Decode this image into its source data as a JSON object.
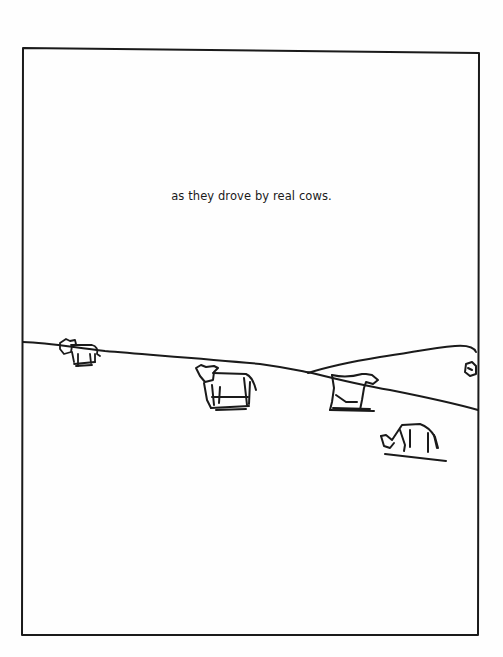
{
  "page": {
    "caption": "as they drove by real cows.",
    "colors": {
      "ink": "#1a1a1a",
      "paper": "#fefefe"
    }
  },
  "illustration": {
    "frame": "hand-drawn rectangular border",
    "scene": "rolling hills with grazing cows",
    "cows": [
      {
        "position": "left hill",
        "pose": "standing"
      },
      {
        "position": "center",
        "pose": "standing"
      },
      {
        "position": "right-center",
        "pose": "lying"
      },
      {
        "position": "right foreground",
        "pose": "grazing"
      },
      {
        "position": "far right edge",
        "pose": "partially visible"
      }
    ]
  }
}
